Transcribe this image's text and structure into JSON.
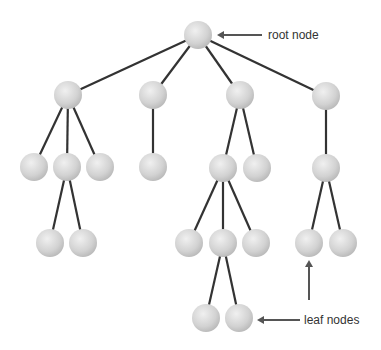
{
  "diagram": {
    "nodes": [
      {
        "id": "root",
        "parent": null
      },
      {
        "id": "a",
        "parent": "root"
      },
      {
        "id": "b",
        "parent": "root"
      },
      {
        "id": "c",
        "parent": "root"
      },
      {
        "id": "d",
        "parent": "root"
      },
      {
        "id": "a1",
        "parent": "a"
      },
      {
        "id": "a2",
        "parent": "a"
      },
      {
        "id": "a3",
        "parent": "a"
      },
      {
        "id": "b1",
        "parent": "b"
      },
      {
        "id": "c1",
        "parent": "c"
      },
      {
        "id": "c2",
        "parent": "c"
      },
      {
        "id": "d1",
        "parent": "d"
      },
      {
        "id": "a2a",
        "parent": "a2"
      },
      {
        "id": "a2b",
        "parent": "a2"
      },
      {
        "id": "c1a",
        "parent": "c1"
      },
      {
        "id": "c1b",
        "parent": "c1"
      },
      {
        "id": "c1c",
        "parent": "c1"
      },
      {
        "id": "d1a",
        "parent": "d1"
      },
      {
        "id": "d1b",
        "parent": "d1"
      },
      {
        "id": "c1b1",
        "parent": "c1b"
      },
      {
        "id": "c1b2",
        "parent": "c1b"
      }
    ],
    "annotations": {
      "root_label": "root node",
      "leaf_label": "leaf nodes"
    },
    "colors": {
      "edge": "#333333",
      "node_light": "#eeeeee",
      "node_dark": "#bdbdbd",
      "arrow": "#555555"
    }
  }
}
